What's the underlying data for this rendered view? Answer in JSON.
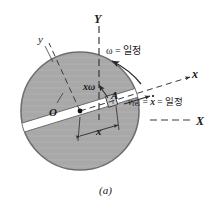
{
  "figure": {
    "caption": "(a)",
    "colors": {
      "disk_fill": "#a9a9a9",
      "disk_stroke": "#6e6e6e",
      "slot_fill": "#ffffff",
      "slider_fill": "#c9c9c9",
      "line": "#2a2a2a",
      "background": "#ffffff"
    },
    "geometry": {
      "disk_center_x": 80,
      "disk_center_y": 111,
      "disk_radius": 59,
      "slot_angle_deg": -17,
      "slider_distance": 35
    }
  },
  "labels": {
    "axis_Y_fixed": "Y",
    "axis_X_fixed": "X",
    "axis_y_rotating": "y",
    "axis_x_rotating": "x",
    "angular_velocity": "ω = 일정",
    "relative_velocity_prefix": "v",
    "relative_velocity_sub": "rel",
    "relative_velocity_eq1": " = ",
    "relative_velocity_xdot": "x",
    "relative_velocity_eq2": " = 일정",
    "transverse_velocity": "xω",
    "point_A": "A",
    "origin_O": "O",
    "radial_distance": "x"
  }
}
